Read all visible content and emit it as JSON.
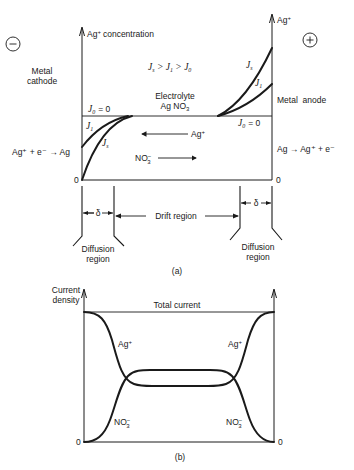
{
  "figure_a": {
    "caption": "(a)",
    "cathode_sign": "−",
    "anode_sign": "+",
    "left_axis_label": "Ag",
    "left_axis_label_sup": "+",
    "left_axis_label_rest": "concentration",
    "right_axis_label": "Ag",
    "right_axis_label_sup": "+",
    "metal_cathode_line1": "Metal",
    "metal_cathode_line2": "cathode",
    "metal_anode": "Metal  anode",
    "inequality": {
      "j_s": "J",
      "j_s_sub": "s",
      "gt1": " > ",
      "j_1": "J",
      "j_1_sub": "1",
      "gt2": " > ",
      "j_0": "J",
      "j_0_sub": "0"
    },
    "electrolyte_line1": "Electrolyte",
    "electrolyte_line2": "Ag NO",
    "electrolyte_sub": "3",
    "j0_left": "= 0",
    "j0_right": "= 0",
    "curve_labels": {
      "left_j1_sub": "1",
      "left_js_sub": "s",
      "right_js_sub": "s",
      "right_j1_sub": "1",
      "J": "J"
    },
    "ag_arrow_label": "Ag",
    "ag_arrow_sup": "+",
    "no3_label": "NO",
    "no3_sub": "3",
    "no3_sup": "−",
    "cathode_reaction": "Ag⁺ + e⁻ → Ag",
    "anode_reaction": "Ag → Ag⁺ + e⁻",
    "zero_left": "0",
    "zero_right": "0",
    "delta": "δ",
    "drift_region": "Drift region",
    "diffusion_left_line1": "Diffusion",
    "diffusion_left_line2": "region",
    "diffusion_right_line1": "Diffusion",
    "diffusion_right_line2": "region"
  },
  "figure_b": {
    "caption": "(b)",
    "y_axis_line1": "Current",
    "y_axis_line2": "density",
    "total_current": "Total current",
    "ag_label": "Ag",
    "ag_sup": "+",
    "no3_label": "NO",
    "no3_sub": "3",
    "no3_sup": "−",
    "zero_left": "0",
    "zero_right": "0"
  }
}
